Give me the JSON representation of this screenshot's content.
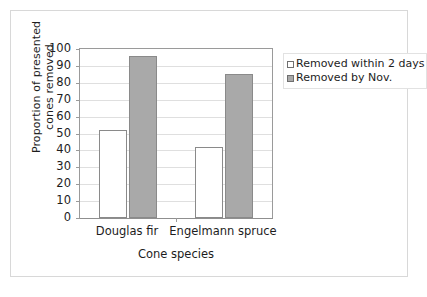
{
  "chart_data": {
    "type": "bar",
    "title": "",
    "xlabel": "Cone species",
    "ylabel": "Proportion of presented cones removed",
    "categories": [
      "Douglas fir",
      "Engelmann spruce"
    ],
    "series": [
      {
        "name": "Removed within 2 days",
        "values": [
          52,
          42
        ],
        "color": "#ffffff"
      },
      {
        "name": "Removed by Nov.",
        "values": [
          96,
          85
        ],
        "color": "#a9a9a9"
      }
    ],
    "ylim": [
      0,
      100
    ],
    "yticks": [
      0,
      10,
      20,
      30,
      40,
      50,
      60,
      70,
      80,
      90,
      100
    ],
    "ytick_labels": [
      "0",
      "10",
      "20",
      "30",
      "40",
      "50",
      "60",
      "70",
      "80",
      "90",
      "100"
    ],
    "grid": "horizontal",
    "legend_position": "right-outside"
  },
  "legend": {
    "items": [
      {
        "label": "Removed within 2 days",
        "swatch": "white-square"
      },
      {
        "label": "Removed by Nov.",
        "swatch": "gray-square"
      }
    ]
  }
}
